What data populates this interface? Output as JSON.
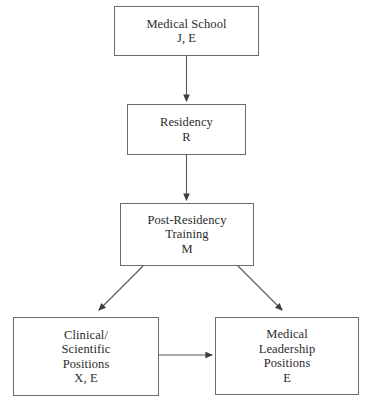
{
  "diagram": {
    "background_color": "#ffffff",
    "line_color": "#555555",
    "text_color": "#2b2b2b",
    "nodes": [
      {
        "id": "medical-school",
        "lines": [
          "Medical School",
          "J, E"
        ],
        "line1": "Medical School",
        "line2": "J, E",
        "line3": "",
        "line4": ""
      },
      {
        "id": "residency",
        "lines": [
          "Residency",
          "R"
        ],
        "line1": "Residency",
        "line2": "R",
        "line3": "",
        "line4": ""
      },
      {
        "id": "post-residency-training",
        "lines": [
          "Post-Residency",
          "Training",
          "M"
        ],
        "line1": "Post-Residency",
        "line2": "Training",
        "line3": "M",
        "line4": ""
      },
      {
        "id": "clinical-scientific-positions",
        "lines": [
          "Clinical/",
          "Scientific",
          "Positions",
          "X, E"
        ],
        "line1": "Clinical/",
        "line2": "Scientific",
        "line3": "Positions",
        "line4": "X, E"
      },
      {
        "id": "medical-leadership-positions",
        "lines": [
          "Medical",
          "Leadership",
          "Positions",
          "E"
        ],
        "line1": "Medical",
        "line2": "Leadership",
        "line3": "Positions",
        "line4": "E"
      }
    ],
    "edges": [
      {
        "id": "medical-school-to-residency",
        "from": "medical-school",
        "to": "residency",
        "style": "vertical-arrow"
      },
      {
        "id": "residency-to-post-residency",
        "from": "residency",
        "to": "post-residency-training",
        "style": "vertical-arrow"
      },
      {
        "id": "post-residency-to-clinical",
        "from": "post-residency-training",
        "to": "clinical-scientific-positions",
        "style": "diagonal-arrow-left"
      },
      {
        "id": "post-residency-to-leadership",
        "from": "post-residency-training",
        "to": "medical-leadership-positions",
        "style": "diagonal-arrow-right"
      },
      {
        "id": "clinical-to-leadership",
        "from": "clinical-scientific-positions",
        "to": "medical-leadership-positions",
        "style": "horizontal-arrow"
      }
    ]
  }
}
